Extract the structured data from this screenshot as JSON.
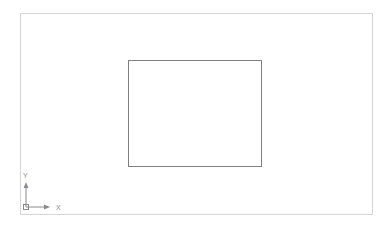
{
  "app": {
    "name": "cad-drawing-area",
    "background_color": "#ffffff"
  },
  "viewport": {
    "label": "drawing-viewport",
    "border_color": "#d5d5d5",
    "x": 20,
    "y": 13,
    "width": 353,
    "height": 202
  },
  "entities": [
    {
      "type": "rectangle",
      "name": "rectangle-entity",
      "stroke_color": "#7f7f7f",
      "fill": "none",
      "x": 128,
      "y": 60,
      "width": 134,
      "height": 107
    }
  ],
  "ucs_icon": {
    "name": "ucs-coordinate-icon",
    "color": "#8a8a8a",
    "x_axis_label": "X",
    "y_axis_label": "Y",
    "origin_marker": "square"
  }
}
